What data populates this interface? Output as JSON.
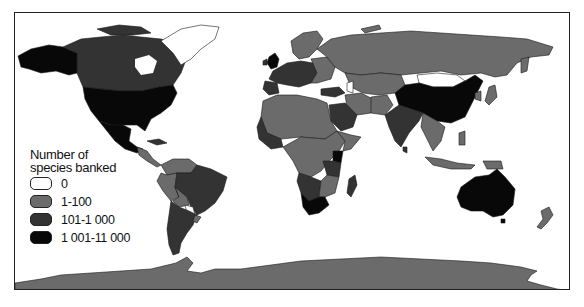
{
  "map": {
    "title": "Number of species banked",
    "legend": {
      "title_line1": "Number of",
      "title_line2": "species banked",
      "items": [
        {
          "label": "0",
          "color": "#ffffff"
        },
        {
          "label": "1-100",
          "color": "#6b6b6b"
        },
        {
          "label": "101-1 000",
          "color": "#333333"
        },
        {
          "label": "1 001-11 000",
          "color": "#080808"
        }
      ]
    },
    "regions": [
      {
        "name": "United States",
        "class": "1 001-11 000"
      },
      {
        "name": "Mexico",
        "class": "1 001-11 000"
      },
      {
        "name": "Alaska",
        "class": "1 001-11 000"
      },
      {
        "name": "Canada",
        "class": "101-1 000"
      },
      {
        "name": "Greenland",
        "class": "0"
      },
      {
        "name": "Brazil",
        "class": "101-1 000"
      },
      {
        "name": "Argentina",
        "class": "101-1 000"
      },
      {
        "name": "Chile",
        "class": "101-1 000"
      },
      {
        "name": "Peru",
        "class": "1-100"
      },
      {
        "name": "Bolivia",
        "class": "1-100"
      },
      {
        "name": "Paraguay",
        "class": "0"
      },
      {
        "name": "United Kingdom",
        "class": "1 001-11 000"
      },
      {
        "name": "Europe (most)",
        "class": "101-1 000"
      },
      {
        "name": "Russia",
        "class": "1-100"
      },
      {
        "name": "Kazakhstan",
        "class": "1-100"
      },
      {
        "name": "Mongolia",
        "class": "0"
      },
      {
        "name": "China",
        "class": "1 001-11 000"
      },
      {
        "name": "India",
        "class": "101-1 000"
      },
      {
        "name": "Saudi Arabia",
        "class": "101-1 000"
      },
      {
        "name": "North Africa",
        "class": "1-100"
      },
      {
        "name": "Kenya",
        "class": "1 001-11 000"
      },
      {
        "name": "Tanzania",
        "class": "101-1 000"
      },
      {
        "name": "South Africa",
        "class": "1 001-11 000"
      },
      {
        "name": "Madagascar",
        "class": "101-1 000"
      },
      {
        "name": "Australia",
        "class": "1 001-11 000"
      },
      {
        "name": "New Zealand",
        "class": "1-100"
      },
      {
        "name": "Antarctica",
        "class": "1-100"
      }
    ]
  }
}
